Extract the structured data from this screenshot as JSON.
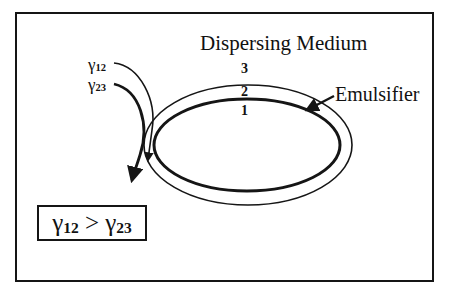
{
  "diagram": {
    "title": "Dispersing Medium",
    "phase_labels": {
      "outer": "3",
      "middle": "2",
      "inner": "1"
    },
    "emulsifier_label": "Emulsifier",
    "tension_labels": [
      {
        "symbol": "γ",
        "subscript": "12"
      },
      {
        "symbol": "γ",
        "subscript": "23"
      }
    ],
    "relation": {
      "left_symbol": "γ",
      "left_sub": "12",
      "operator": ">",
      "right_symbol": "γ",
      "right_sub": "23"
    },
    "colors": {
      "line": "#151515",
      "background": "#ffffff"
    }
  }
}
